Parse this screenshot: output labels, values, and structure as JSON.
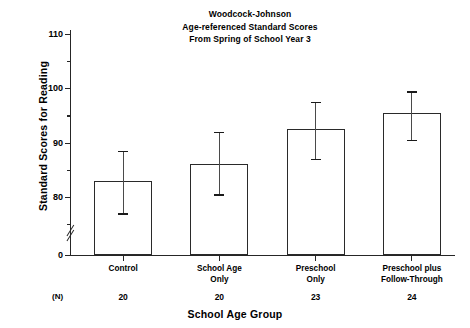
{
  "chart_data": {
    "type": "bar",
    "title": "Woodcock-Johnson Age-referenced Standard Scores From Spring of School Year 3",
    "title_lines": [
      "Woodcock-Johnson",
      "Age-referenced Standard Scores",
      "From Spring of School Year 3"
    ],
    "xlabel": "School Age Group",
    "ylabel": "Standard Scores for Reading",
    "categories": [
      "Control",
      "School Age Only",
      "Preschool Only",
      "Preschool plus Follow-Through"
    ],
    "category_lines": [
      [
        "Control"
      ],
      [
        "School Age",
        "Only"
      ],
      [
        "Preschool",
        "Only"
      ],
      [
        "Preschool plus",
        "Follow-Through"
      ]
    ],
    "values": [
      83,
      86,
      92.5,
      95.5
    ],
    "error_high": [
      88.5,
      92,
      97.5,
      99.5
    ],
    "error_low": [
      77,
      80.5,
      87,
      90.5
    ],
    "n_label": "(N)",
    "n_values": [
      20,
      20,
      23,
      24
    ],
    "ylim": [
      0,
      110
    ],
    "axis_break": true,
    "axis_break_between": [
      0,
      75
    ],
    "ytick_major": [
      0,
      80,
      90,
      100,
      110
    ],
    "ytick_major_labels": [
      "0",
      "80",
      "90",
      "100",
      "110"
    ],
    "ytick_minor": [
      75,
      85,
      95,
      105
    ],
    "grid": false,
    "legend": "none",
    "bar_fill": "#ffffff",
    "bar_edge": "#2a2a2a",
    "error_color": "#4a4a4a",
    "background": "#ffffff"
  }
}
